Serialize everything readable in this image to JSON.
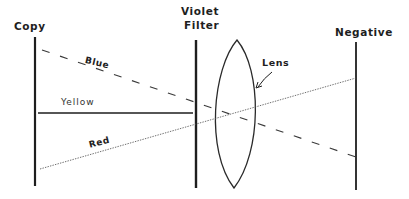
{
  "diagram": {
    "planes": {
      "copy": {
        "label": "Copy"
      },
      "filter": {
        "label_line1": "Violet",
        "label_line2": "Filter"
      },
      "lens": {
        "label": "Lens"
      },
      "negative": {
        "label": "Negative"
      }
    },
    "rays": [
      {
        "name": "Blue",
        "label": "Blue",
        "style": "dashed",
        "passes_filter": true
      },
      {
        "name": "Yellow",
        "label": "Yellow",
        "style": "solid",
        "passes_filter": false
      },
      {
        "name": "Red",
        "label": "Red",
        "style": "dotted",
        "passes_filter": true
      }
    ],
    "colors": {
      "ink": "#1e1e1e",
      "background": "#ffffff"
    }
  }
}
